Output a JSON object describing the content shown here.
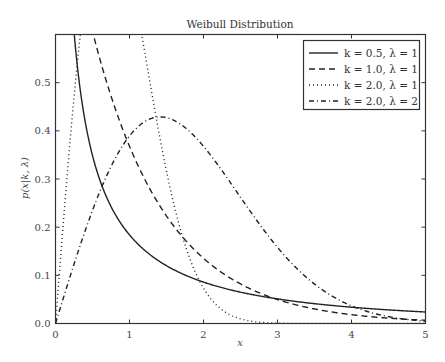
{
  "chart_data": {
    "type": "line",
    "title": "Weibull Distribution",
    "xlabel": "x",
    "ylabel": "p(x|k, λ)",
    "xlim": [
      0,
      5
    ],
    "ylim": [
      0,
      0.6
    ],
    "xticks": [
      "0",
      "1",
      "2",
      "3",
      "4",
      "5"
    ],
    "yticks": [
      "0.0",
      "0.1",
      "0.2",
      "0.3",
      "0.4",
      "0.5"
    ],
    "grid": false,
    "legend_position": "upper right",
    "series": [
      {
        "name": "k = 0.5,  λ = 1",
        "k": 0.5,
        "lambda": 1,
        "style": "solid",
        "x": [
          0.05,
          0.1,
          0.2,
          0.3,
          0.5,
          0.75,
          1.0,
          1.5,
          2.0,
          3.0,
          4.0,
          5.0
        ],
        "values": [
          1.8,
          1.15,
          0.57,
          0.53,
          0.35,
          0.24,
          0.18,
          0.12,
          0.086,
          0.051,
          0.034,
          0.024
        ]
      },
      {
        "name": "k = 1.0,  λ = 1",
        "k": 1.0,
        "lambda": 1,
        "style": "dashed",
        "x": [
          0,
          0.5,
          1.0,
          1.5,
          2.0,
          3.0,
          4.0,
          5.0
        ],
        "values": [
          0.5,
          0.39,
          0.3,
          0.24,
          0.18,
          0.11,
          0.068,
          0.041
        ]
      },
      {
        "name": "k = 2.0,  λ = 1",
        "k": 2.0,
        "lambda": 1,
        "style": "dotted",
        "x": [
          0,
          0.25,
          0.5,
          0.71,
          1.0,
          1.5,
          2.0,
          2.5,
          3.0
        ],
        "values": [
          0,
          0.235,
          0.389,
          0.429,
          0.368,
          0.158,
          0.037,
          0.005,
          0.0
        ]
      },
      {
        "name": "k = 2.0,  λ = 2",
        "k": 2.0,
        "lambda": 2,
        "style": "dashdot",
        "x": [
          0,
          0.5,
          1.0,
          1.41,
          2.0,
          3.0,
          4.0,
          5.0
        ],
        "values": [
          0,
          0.118,
          0.195,
          0.214,
          0.184,
          0.079,
          0.018,
          0.002
        ]
      }
    ]
  }
}
